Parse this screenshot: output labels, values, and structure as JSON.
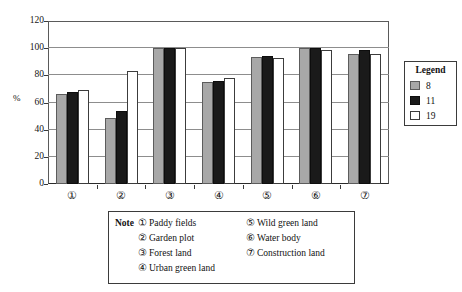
{
  "chart_data": {
    "type": "bar",
    "title": "",
    "subtitle": "",
    "xlabel": "",
    "ylabel": "%",
    "ylim": [
      0,
      120
    ],
    "yticks": [
      0,
      20,
      40,
      60,
      80,
      100,
      120
    ],
    "grid": true,
    "legend_position": "right-outside",
    "legend_title": "Legend",
    "categories": [
      "①",
      "②",
      "③",
      "④",
      "⑤",
      "⑥",
      "⑦"
    ],
    "category_names": [
      "Paddy fields",
      "Garden plot",
      "Forest land",
      "Urban green land",
      "Wild green land",
      "Water body",
      "Construction land"
    ],
    "series": [
      {
        "name": "8",
        "color": "#a8a8a8",
        "values": [
          66.0,
          48.5,
          100.0,
          75.0,
          93.5,
          100.0,
          96.0
        ]
      },
      {
        "name": "11",
        "color": "#1a1a1a",
        "values": [
          68.0,
          54.0,
          100.0,
          76.0,
          94.5,
          100.0,
          98.5
        ]
      },
      {
        "name": "19",
        "color": "#ffffff",
        "values": [
          69.0,
          83.5,
          100.0,
          78.0,
          92.5,
          98.5,
          96.0
        ]
      }
    ]
  },
  "legend": {
    "title": "Legend",
    "entries": [
      {
        "label": "8"
      },
      {
        "label": "11"
      },
      {
        "label": "19"
      }
    ]
  },
  "note": {
    "label": "Note",
    "left_column": [
      {
        "marker": "①",
        "text": "Paddy fields"
      },
      {
        "marker": "②",
        "text": "Garden plot"
      },
      {
        "marker": "③",
        "text": "Forest land"
      },
      {
        "marker": "④",
        "text": "Urban green land"
      }
    ],
    "right_column": [
      {
        "marker": "⑤",
        "text": "Wild green land"
      },
      {
        "marker": "⑥",
        "text": "Water body"
      },
      {
        "marker": "⑦",
        "text": "Construction land"
      }
    ]
  },
  "axis": {
    "y_title": "%",
    "y_tick_labels": [
      "120",
      "100",
      "80",
      "60",
      "40",
      "20",
      "0"
    ],
    "x_tick_labels": [
      "①",
      "②",
      "③",
      "④",
      "⑤",
      "⑥",
      "⑦"
    ]
  },
  "colors": {
    "series_8": "#a8a8a8",
    "series_11": "#1a1a1a",
    "series_19": "#ffffff",
    "grid": "#8d8d8d",
    "axis": "#3a3a3a",
    "background": "#ffffff"
  }
}
